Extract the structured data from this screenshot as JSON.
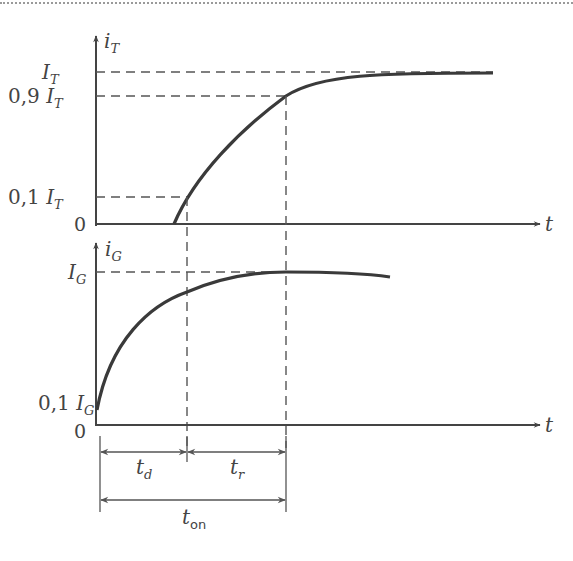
{
  "diagram": {
    "upper_plot": {
      "y_axis_label": {
        "main": "i",
        "sub": "T"
      },
      "x_axis_label": "t",
      "levels": [
        {
          "prefix": "",
          "main": "I",
          "sub": "T"
        },
        {
          "prefix": "0,9 ",
          "main": "I",
          "sub": "T"
        },
        {
          "prefix": "0,1 ",
          "main": "I",
          "sub": "T"
        },
        {
          "prefix": "0",
          "main": "",
          "sub": ""
        }
      ]
    },
    "lower_plot": {
      "y_axis_label": {
        "main": "i",
        "sub": "G"
      },
      "x_axis_label": "t",
      "levels": [
        {
          "prefix": "",
          "main": "I",
          "sub": "G"
        },
        {
          "prefix": "0,1 ",
          "main": "I",
          "sub": "G"
        },
        {
          "prefix": "0",
          "main": "",
          "sub": ""
        }
      ]
    },
    "intervals": {
      "delay": {
        "main": "t",
        "sub": "d"
      },
      "rise": {
        "main": "t",
        "sub": "r"
      },
      "on": {
        "main": "t",
        "sub": "on"
      }
    },
    "colors": {
      "line": "#444444",
      "dash": "#555555"
    }
  }
}
